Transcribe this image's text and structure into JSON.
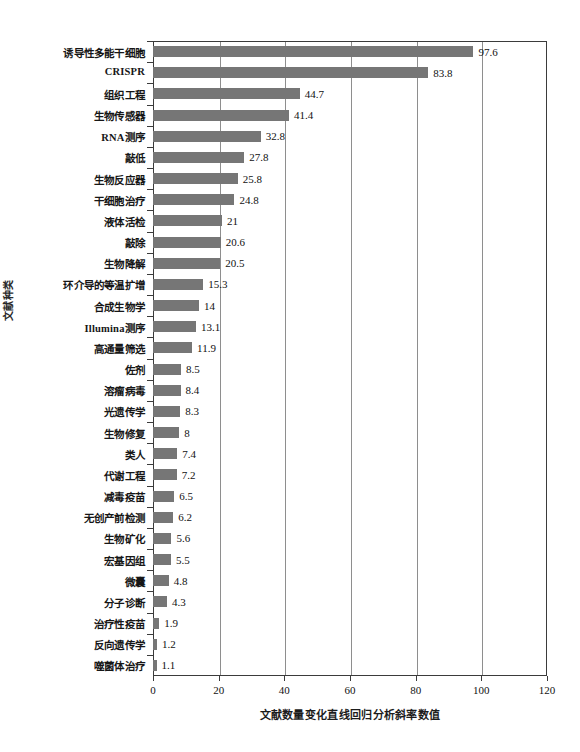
{
  "chart_data": {
    "type": "bar",
    "orientation": "horizontal",
    "title": "",
    "xlabel": "文献数量变化直线回归分析斜率数值",
    "ylabel": "文献种类",
    "xlim": [
      0,
      120
    ],
    "xticks": [
      0,
      20,
      40,
      60,
      80,
      100,
      120
    ],
    "grid": true,
    "legend": null,
    "bar_color": "#767676",
    "categories": [
      "诱导性多能干细胞",
      "CRISPR",
      "组织工程",
      "生物传感器",
      "RNA测序",
      "敲低",
      "生物反应器",
      "干细胞治疗",
      "液体活检",
      "敲除",
      "生物降解",
      "环介导的等温扩增",
      "合成生物学",
      "Illumina测序",
      "高通量筛选",
      "佐剂",
      "溶瘤病毒",
      "光遗传学",
      "生物修复",
      "类人",
      "代谢工程",
      "减毒疫苗",
      "无创产前检测",
      "生物矿化",
      "宏基因组",
      "微囊",
      "分子诊断",
      "治疗性疫苗",
      "反向遗传学",
      "噬菌体治疗"
    ],
    "values": [
      97.6,
      83.8,
      44.7,
      41.4,
      32.8,
      27.8,
      25.8,
      24.8,
      21,
      20.6,
      20.5,
      15.3,
      14,
      13.1,
      11.9,
      8.5,
      8.4,
      8.3,
      8,
      7.4,
      7.2,
      6.5,
      6.2,
      5.6,
      5.5,
      4.8,
      4.3,
      1.9,
      1.2,
      1.1
    ],
    "value_labels": [
      "97.6",
      "83.8",
      "44.7",
      "41.4",
      "32.8",
      "27.8",
      "25.8",
      "24.8",
      "21",
      "20.6",
      "20.5",
      "15.3",
      "14",
      "13.1",
      "11.9",
      "8.5",
      "8.4",
      "8.3",
      "8",
      "7.4",
      "7.2",
      "6.5",
      "6.2",
      "5.6",
      "5.5",
      "4.8",
      "4.3",
      "1.9",
      "1.2",
      "1.1"
    ]
  }
}
